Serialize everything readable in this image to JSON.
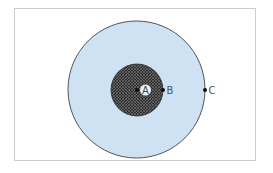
{
  "diagram": {
    "type": "concentric-circles",
    "outer_circle": {
      "cx": 136.5,
      "cy": 89.5,
      "r": 68.5,
      "fill": "#cfe2f3",
      "stroke": "#555555"
    },
    "inner_circle": {
      "cx": 137,
      "cy": 90,
      "r": 26,
      "fill": "#3a3a3a",
      "pattern": "crosshatch"
    },
    "points": [
      {
        "id": "A",
        "label": "A",
        "x": 137,
        "y": 90,
        "label_x": 145.5,
        "label_y": 90,
        "label_bg": "#e8eef4"
      },
      {
        "id": "B",
        "label": "B",
        "x": 163,
        "y": 90,
        "label_x": 169,
        "label_y": 90
      },
      {
        "id": "C",
        "label": "C",
        "x": 205,
        "y": 90,
        "label_x": 211,
        "label_y": 90
      }
    ]
  }
}
